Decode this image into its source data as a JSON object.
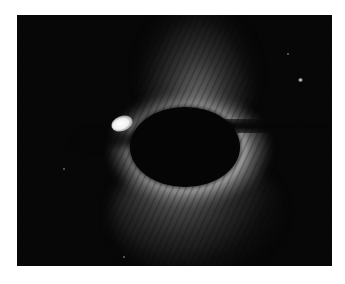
{
  "image": {
    "description": "Grayscale scattering pattern photograph with dark elliptical beam stop, bright halo, and a bright spot at left edge of the beam stop",
    "background": "#ffffff",
    "frame_color": "#070707",
    "elements": {
      "beam_stop": "dark ellipse at center",
      "beam_arm": "dark horizontal bar extending to right edge",
      "bright_spot": "saturated white spot left of beam stop",
      "small_spot": "faint bright dot upper right",
      "halo": "diffuse scattering lobes above and below beam stop with diagonal fringe pattern"
    }
  }
}
